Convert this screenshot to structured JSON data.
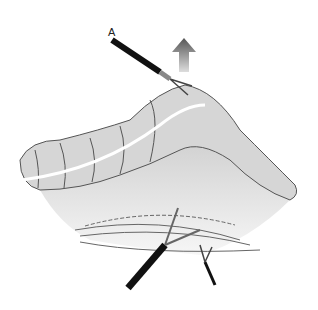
{
  "figure": {
    "labels": {
      "a": "A"
    },
    "colors": {
      "instrument": "#111111",
      "tissue": "#d4d4d4",
      "outline": "#555555",
      "arrow": "#888888"
    }
  }
}
